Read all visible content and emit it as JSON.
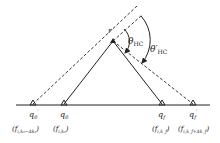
{
  "diagram": {
    "apex_label": "r",
    "angle_labels": {
      "theta_hc": "θ",
      "theta_hc_sub": "HC",
      "theta_hc_prime": "θ′",
      "theta_hc_prime_sub": "HC"
    },
    "points": [
      {
        "name": "q0-prime",
        "label": "q",
        "sub": "0",
        "prime": "′",
        "freq": "(f",
        "freq_sub": "i,k₀−Δk₀",
        "freq_close": ")"
      },
      {
        "name": "q0",
        "label": "q",
        "sub": "0",
        "prime": "",
        "freq": "(f",
        "freq_sub": "i,k₀",
        "freq_close": ")"
      },
      {
        "name": "qf",
        "label": "q",
        "sub": "f",
        "prime": "",
        "freq": "(f",
        "freq_sub": "i,k_f",
        "freq_close": ")"
      },
      {
        "name": "qf-prime",
        "label": "q",
        "sub": "f",
        "prime": "′",
        "freq": "(f",
        "freq_sub": "i,k_f+Δk_f",
        "freq_close": ")"
      }
    ],
    "colors": {
      "line": "#222222",
      "background": "#ffffff"
    }
  }
}
